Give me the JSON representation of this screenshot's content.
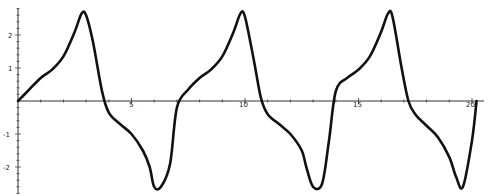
{
  "chart_data": {
    "type": "line",
    "title": "",
    "xlabel": "",
    "ylabel": "",
    "xlim": [
      0,
      20.3
    ],
    "ylim": [
      -2.6,
      2.8
    ],
    "grid": false,
    "legend": null,
    "x_ticks": [
      5,
      10,
      15,
      20
    ],
    "y_ticks": [
      -2,
      -1,
      1,
      2
    ],
    "series": [
      {
        "name": "f(x)",
        "color": "#111111",
        "x": [
          0,
          0.5,
          1.0,
          1.5,
          2.0,
          2.5,
          2.8,
          3.0,
          3.3,
          3.7,
          4.0,
          4.5,
          5.0,
          5.5,
          5.8,
          6.0,
          6.3,
          6.7,
          7.0,
          7.5,
          8.0,
          8.5,
          9.0,
          9.5,
          9.8,
          10.0,
          10.4,
          10.7,
          11.0,
          11.5,
          12.0,
          12.5,
          12.7,
          13.0,
          13.4,
          13.7,
          14.0,
          14.5,
          15.0,
          15.5,
          16.0,
          16.3,
          16.5,
          16.9,
          17.2,
          17.5,
          18.0,
          18.5,
          19.0,
          19.3,
          19.6,
          20.0,
          20.2
        ],
        "y": [
          0,
          0.35,
          0.7,
          0.95,
          1.35,
          2.1,
          2.65,
          2.6,
          1.8,
          0.3,
          -0.35,
          -0.7,
          -1.0,
          -1.5,
          -2.0,
          -2.6,
          -2.6,
          -1.9,
          -0.2,
          0.35,
          0.7,
          0.95,
          1.35,
          2.1,
          2.65,
          2.55,
          1.2,
          0.1,
          -0.4,
          -0.7,
          -1.0,
          -1.5,
          -2.0,
          -2.6,
          -2.5,
          -1.2,
          0.3,
          0.7,
          0.95,
          1.35,
          2.1,
          2.65,
          2.55,
          1.0,
          0.0,
          -0.4,
          -0.75,
          -1.1,
          -1.7,
          -2.3,
          -2.6,
          -1.2,
          0.0
        ]
      }
    ]
  },
  "axes": {
    "x_tick_labels": [
      "5",
      "10",
      "15",
      "20"
    ],
    "y_tick_labels": [
      "2",
      "1",
      "-1",
      "-2"
    ]
  }
}
